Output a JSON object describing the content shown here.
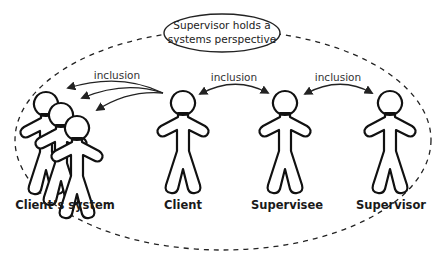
{
  "bubble": {
    "line1": "Supervisor holds a",
    "line2": "systems perspective"
  },
  "arrows": [
    {
      "label": "inclusion",
      "from": "Client",
      "to": "Client's system",
      "type": "one-way-triple"
    },
    {
      "label": "inclusion",
      "from": "Client",
      "to": "Supervisee",
      "type": "two-way"
    },
    {
      "label": "inclusion",
      "from": "Supervisee",
      "to": "Supervisor",
      "type": "two-way"
    }
  ],
  "figures": [
    {
      "label": "Client’s system"
    },
    {
      "label": "Client"
    },
    {
      "label": "Supervisee"
    },
    {
      "label": "Supervisor"
    }
  ],
  "colors": {
    "stroke": "#111111",
    "background": "#ffffff"
  }
}
